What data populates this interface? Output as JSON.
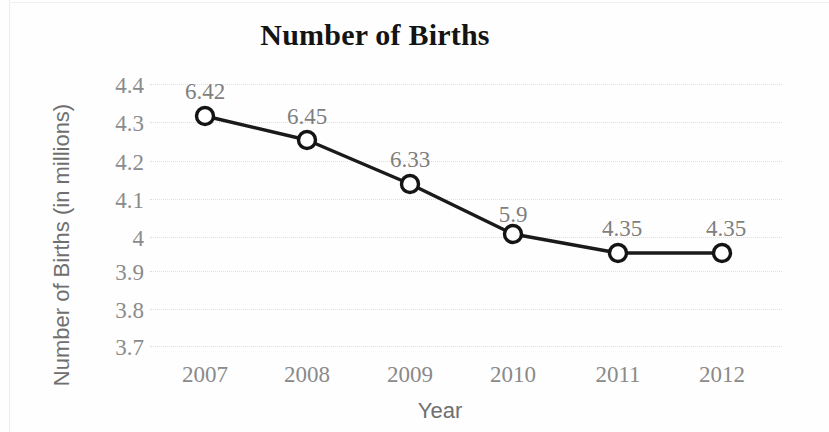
{
  "chart_data": {
    "type": "line",
    "title": "Number of Births",
    "xlabel": "Year",
    "ylabel": "Number of Births (in millions)",
    "categories": [
      "2007",
      "2008",
      "2009",
      "2010",
      "2011",
      "2012"
    ],
    "values": [
      4.32,
      4.255,
      4.13,
      4.0,
      3.95,
      3.95
    ],
    "point_labels": [
      "6.42",
      "6.45",
      "6.33",
      "5.9",
      "4.35",
      "4.35"
    ],
    "ylim": [
      3.7,
      4.4
    ],
    "y_ticks": [
      "4.4",
      "4.3",
      "4.2",
      "4.1",
      "4",
      "3.9",
      "3.8",
      "3.7"
    ],
    "y_tick_values": [
      4.4,
      4.3,
      4.2,
      4.1,
      4.0,
      3.9,
      3.8,
      3.7
    ],
    "grid": "horizontal-dotted",
    "legend": "none",
    "marker": "open-circle",
    "line_color": "#1a1a1a",
    "marker_fill": "#ffffff",
    "marker_stroke": "#141414",
    "grid_color": "#dedede",
    "tick_label_color": "#8a8a8a",
    "title_color": "#141414",
    "axis_title_color": "#6f6f6f"
  },
  "geometry": {
    "point_x": [
      205,
      307,
      410,
      513,
      618,
      722
    ],
    "point_y": [
      116,
      140,
      184,
      234,
      253,
      253
    ],
    "y_tick_y": [
      85,
      123,
      162,
      200,
      238,
      272,
      310,
      347
    ],
    "grid_y": [
      84,
      122,
      161,
      199,
      237,
      271,
      309,
      346
    ],
    "label_x": [
      205,
      307,
      410,
      513,
      622,
      726
    ],
    "label_y": [
      80,
      105,
      148,
      203,
      217,
      217
    ],
    "x_tick_y": 363
  }
}
